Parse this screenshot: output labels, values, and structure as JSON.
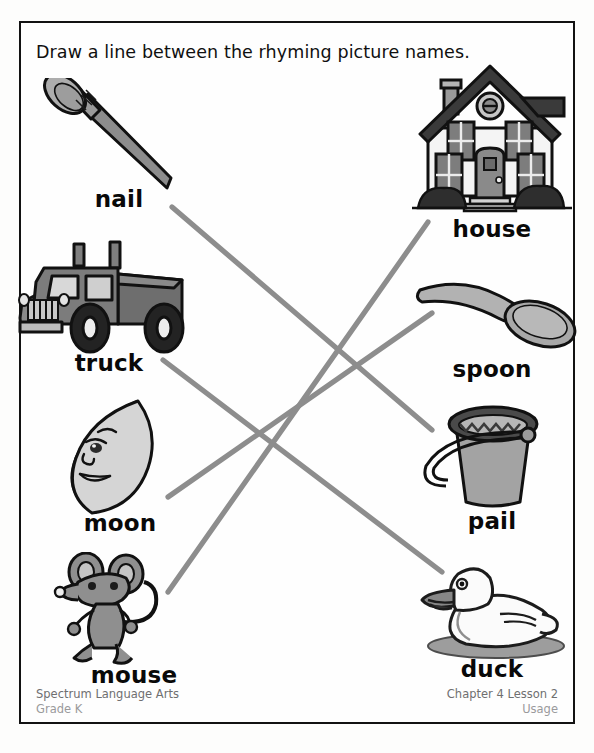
{
  "worksheet": {
    "instruction": "Draw a line between the rhyming picture names.",
    "line_color": "#8d8d8d",
    "border_color": "#121212",
    "text_color": "#090909"
  },
  "left_column": [
    {
      "id": "nail",
      "label": "nail",
      "icon": "nail-icon"
    },
    {
      "id": "truck",
      "label": "truck",
      "icon": "truck-icon"
    },
    {
      "id": "moon",
      "label": "moon",
      "icon": "moon-icon"
    },
    {
      "id": "mouse",
      "label": "mouse",
      "icon": "mouse-icon"
    }
  ],
  "right_column": [
    {
      "id": "house",
      "label": "house",
      "icon": "house-icon"
    },
    {
      "id": "spoon",
      "label": "spoon",
      "icon": "spoon-icon"
    },
    {
      "id": "pail",
      "label": "pail",
      "icon": "pail-icon"
    },
    {
      "id": "duck",
      "label": "duck",
      "icon": "duck-icon"
    }
  ],
  "connections": [
    {
      "from": "nail",
      "to": "pail",
      "x1": 172,
      "y1": 207,
      "x2": 432,
      "y2": 430
    },
    {
      "from": "truck",
      "to": "duck",
      "x1": 163,
      "y1": 360,
      "x2": 442,
      "y2": 572
    },
    {
      "from": "moon",
      "to": "spoon",
      "x1": 168,
      "y1": 497,
      "x2": 432,
      "y2": 313
    },
    {
      "from": "mouse",
      "to": "house",
      "x1": 168,
      "y1": 592,
      "x2": 428,
      "y2": 222
    }
  ],
  "footer": {
    "left_line1": "Spectrum Language Arts",
    "left_line2": "Grade K",
    "right_line1": "Chapter 4 Lesson 2",
    "right_line2": "Usage"
  }
}
